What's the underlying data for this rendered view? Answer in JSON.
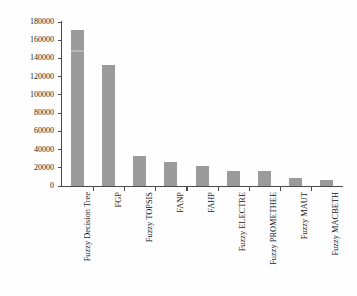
{
  "chart_data": {
    "type": "bar",
    "title": "",
    "xlabel": "",
    "ylabel": "No. of References",
    "ylim": [
      0,
      180000
    ],
    "ytick_step": 20000,
    "grid": false,
    "legend": null,
    "bar_color": "#9b9b9b",
    "axis_color": "#4a4a4a",
    "background_color": "#fefefe",
    "categories": [
      "Fuzzy Decision Tree",
      "FGP",
      "Fuzzy TOPSIS",
      "FANP",
      "FAHP",
      "Fuzzy ELECTRE",
      "Fuzzy PROMETHEE",
      "Fuzzy MAUT",
      "Fuzzy MACBETH"
    ],
    "values": [
      171000,
      133000,
      33000,
      26000,
      22000,
      17000,
      17000,
      9000,
      7000
    ],
    "ytick_labels": [
      "180000",
      "160000",
      "140000",
      "120000",
      "100000",
      "80000",
      "60000",
      "40000",
      "20000",
      "0"
    ],
    "ytick_values": [
      180000,
      160000,
      140000,
      120000,
      100000,
      80000,
      60000,
      40000,
      20000,
      0
    ]
  }
}
